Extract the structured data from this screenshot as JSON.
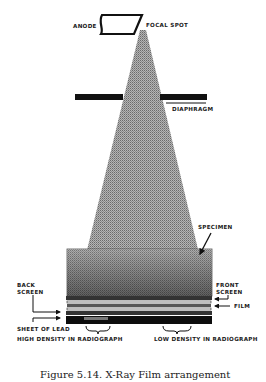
{
  "diagram": {
    "title": "X-Ray Film arrangement",
    "labels": {
      "anode": "ANODE",
      "focal_spot": "FOCAL SPOT",
      "diaphragm": "DIAPHRAGM",
      "specimen": "SPECIMEN",
      "back_screen_line1": "BACK",
      "back_screen_line2": "SCREEN",
      "front_screen_line1": "FRONT",
      "front_screen_line2": "SCREEN",
      "film": "FILM",
      "sheet_of_lead": "SHEET OF LEAD",
      "high_density": "HIGH DENSITY IN RADIOGRAPH",
      "low_density": "LOW DENSITY IN RADIOGRAPH"
    },
    "caption": "Figure 5.14. X-Ray Film arrangement",
    "colors": {
      "ink": "#111111",
      "beam": "#9a9a9a",
      "specimen": "#8c8c8c",
      "background": "#ffffff"
    }
  }
}
